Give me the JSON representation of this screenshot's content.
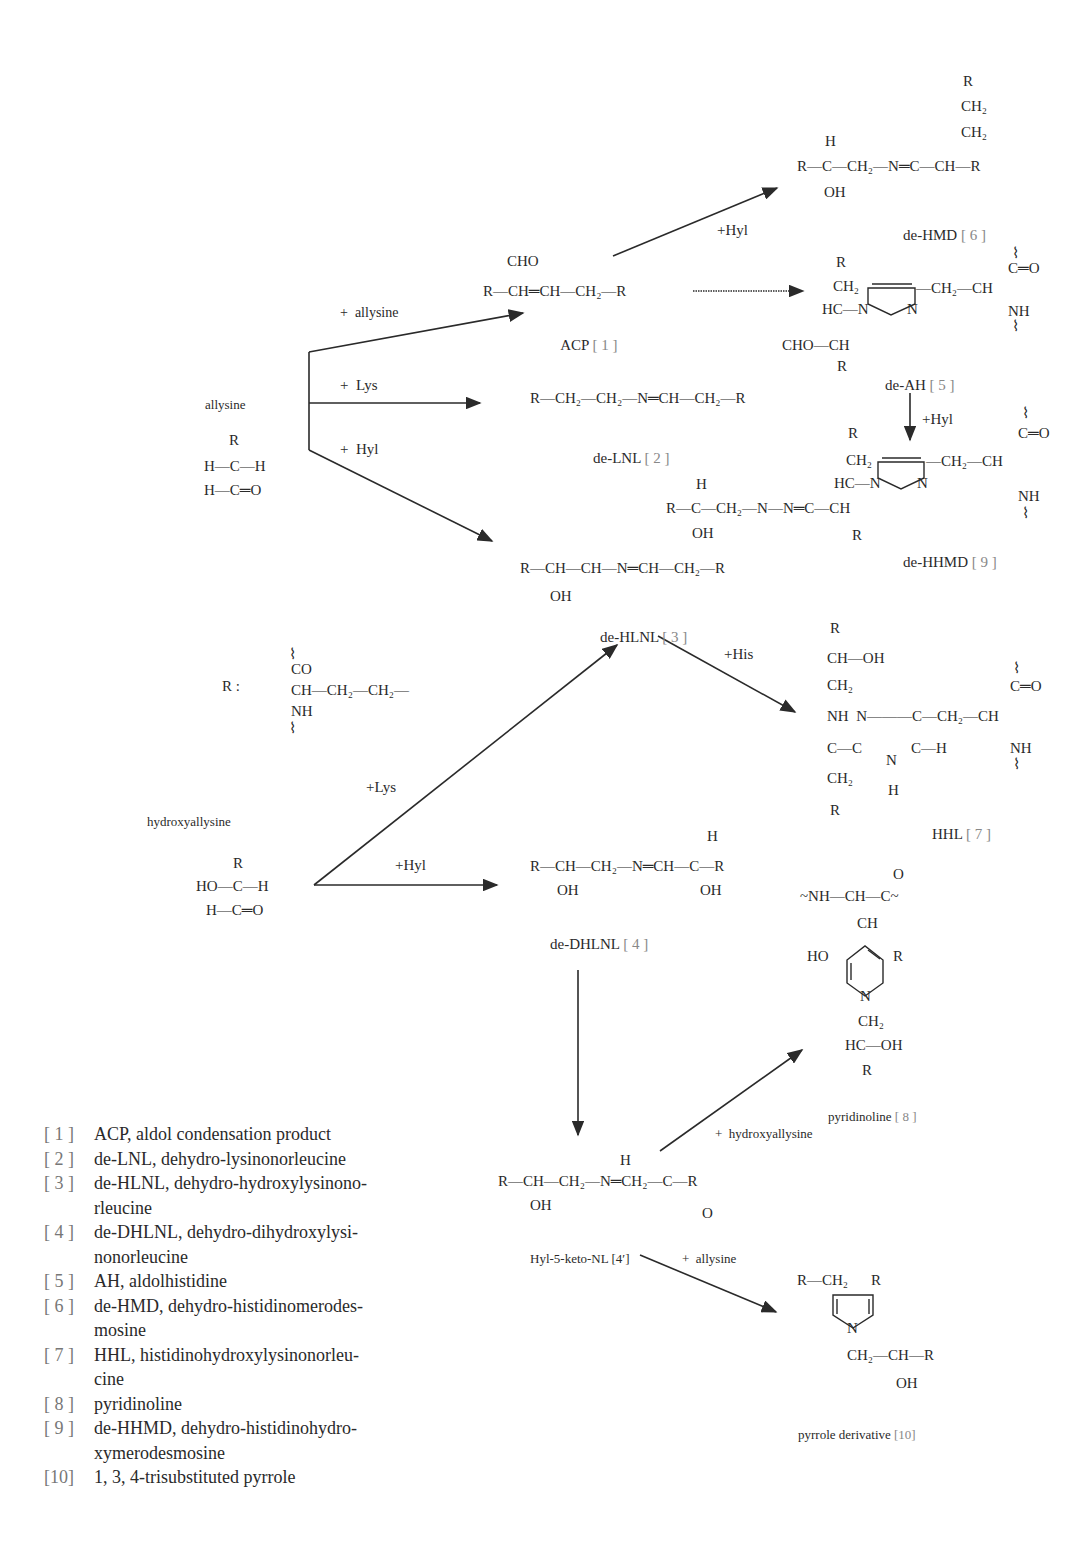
{
  "diagram": {
    "starting_materials": {
      "allysine": {
        "label": "allysine",
        "structure": [
          "  R",
          "  |",
          "H-C-H",
          "  |",
          "H-C=O"
        ]
      },
      "hydroxyallysine": {
        "label": "hydroxyallysine",
        "structure": [
          "    R",
          "    |",
          "HO-C-H",
          "    |",
          " H-C=O"
        ]
      },
      "r_group": {
        "label": "R :",
        "structure": [
          "  ⌇",
          " CO",
          "  |",
          " CH—CH₂—CH₂—",
          "  |",
          " NH",
          "  ⌇"
        ]
      }
    },
    "reagents": {
      "allysine_plus_allysine": "+  allysine",
      "allysine_plus_lys": "+  Lys",
      "allysine_plus_hyl": "+  Hyl",
      "acp_plus_hyl": "+Hyl",
      "deah_plus_hyl": "+Hyl",
      "dehlnl_plus_his": "+His",
      "hydroxyallysine_plus_lys": "+Lys",
      "hydroxyallysine_plus_hyl": "+Hyl",
      "keto_plus_hydroxyallysine": "+  hydroxyallysine",
      "keto_plus_allysine": "+  allysine"
    },
    "compounds": [
      {
        "id": "1",
        "name": "ACP",
        "ref": "[ 1 ]",
        "structure": [
          "      CHO",
          "       |",
          "R—CH═CH—CH₂—R"
        ]
      },
      {
        "id": "2",
        "name": "de-LNL",
        "ref": "[ 2 ]",
        "structure": [
          "R—CH₂—CH₂—N═CH—CH₂—R"
        ]
      },
      {
        "id": "3",
        "name": "de-HLNL",
        "ref": "[ 3 ]",
        "structure": [
          "R—CH—CH—N═CH—CH₂—R",
          "    |",
          "   OH"
        ]
      },
      {
        "id": "4",
        "name": "de-DHLNL",
        "ref": "[ 4 ]",
        "structure": [
          "                           H",
          "                           |",
          "R—CH—CH₂—N═CH—C—R",
          "    |                      |",
          "   OH                    OH"
        ]
      },
      {
        "id": "4'",
        "name": "Hyl-5-keto-NL",
        "ref": "[4′]",
        "structure": [
          "                   H",
          "R—CH—CH₂—N═CH₂—C—R",
          "    |                       ‖",
          "   OH                      O"
        ]
      },
      {
        "id": "5",
        "name": "de-AH",
        "ref": "[ 5 ]"
      },
      {
        "id": "6",
        "name": "de-HMD",
        "ref": "[ 6 ]"
      },
      {
        "id": "7",
        "name": "HHL",
        "ref": "[ 7 ]"
      },
      {
        "id": "8",
        "name": "pyridinoline",
        "ref": "[ 8 ]"
      },
      {
        "id": "9",
        "name": "de-HHMD",
        "ref": "[ 9 ]"
      },
      {
        "id": "10",
        "name": "pyrrole derivative",
        "ref": "[10]"
      }
    ],
    "structure_text": {
      "c6": {
        "r_top": "R",
        "ch2a": "CH₂",
        "ch2b": "CH₂",
        "h": "H",
        "main": "R—C—CH₂—N═C—CH—R",
        "oh": "OH"
      },
      "c5": {
        "r_top": "R",
        "ch2": "CH₂",
        "hc": "HC—N",
        "n": "N",
        "choch": "CHO—CH",
        "r_bot": "R",
        "ch2r": "—CH₂—CH",
        "co": "C═O",
        "nh": "NH",
        "wave": "⌇"
      },
      "c9": {
        "r_top": "R",
        "ch2": "CH₂",
        "hc": "HC—N",
        "n": "N",
        "h": "H",
        "main": "R—C—CH₂—N—N═C—CH",
        "oh": "OH",
        "r_bot": "R",
        "ch2r": "—CH₂—CH",
        "co": "C═O",
        "nh": "NH",
        "wave": "⌇"
      },
      "c7": {
        "r_top": "R",
        "choh": "CH—OH",
        "ch2a": "CH₂",
        "nh_n": "NH  N———C—CH₂—CH",
        "c_c": "C—C",
        "ch": "C—H",
        "n_ring": "N",
        "h_ring": "H",
        "ch2b": "CH₂",
        "r_bot": "R",
        "co": "C═O",
        "nh": "NH",
        "wave": "⌇"
      },
      "c8": {
        "o": "O",
        "top": "~NH—CH—C~",
        "ch": "CH",
        "ho": "HO",
        "r": "R",
        "n": "N",
        "ch2": "CH₂",
        "hcoh": "HC—OH",
        "r_bot": "R"
      },
      "c10": {
        "rch2": "R—CH₂",
        "r": "R",
        "n": "N",
        "chain": "CH₂—CH—R",
        "oh": "OH"
      }
    }
  },
  "legend": [
    {
      "num": "[ 1 ]",
      "text": "ACP, aldol condensation product"
    },
    {
      "num": "[ 2 ]",
      "text": "de-LNL, dehydro-lysinonorleucine"
    },
    {
      "num": "[ 3 ]",
      "text": "de-HLNL, dehydro-hydroxylysinono-",
      "cont": "rleucine"
    },
    {
      "num": "[ 4 ]",
      "text": "de-DHLNL,  dehydro-dihydroxylysi-",
      "cont": "nonorleucine"
    },
    {
      "num": "[ 5 ]",
      "text": "AH, aldolhistidine"
    },
    {
      "num": "[ 6 ]",
      "text": "de-HMD,  dehydro-histidinomerodes-",
      "cont": "mosine"
    },
    {
      "num": "[ 7 ]",
      "text": "HHL,  histidinohydroxylysinonorleu-",
      "cont": "cine"
    },
    {
      "num": "[ 8 ]",
      "text": "pyridinoline"
    },
    {
      "num": "[ 9 ]",
      "text": "de-HHMD,  dehydro-histidinohydro-",
      "cont": "xymerodesmosine"
    },
    {
      "num": "[10]",
      "text": "1, 3, 4-trisubstituted pyrrole"
    }
  ],
  "colors": {
    "ink": "#2a2a2a",
    "ref_gray": "#888888",
    "background": "#ffffff"
  }
}
